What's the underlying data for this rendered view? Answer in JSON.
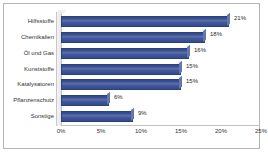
{
  "chart_data": {
    "type": "bar",
    "orientation": "horizontal",
    "title": "",
    "xlabel": "",
    "ylabel": "",
    "categories": [
      "Hilfsstoffe",
      "Chemikalien",
      "Öl und Gas",
      "Kunststoffe",
      "Katalysatoren",
      "Pflanzenschutz",
      "Sonstige"
    ],
    "values": [
      21,
      18,
      16,
      15,
      15,
      6,
      9
    ],
    "data_labels": [
      "21%",
      "18%",
      "16%",
      "15%",
      "15%",
      "6%",
      "9%"
    ],
    "xlim": [
      0,
      25
    ],
    "xticks": [
      0,
      5,
      10,
      15,
      20,
      25
    ],
    "xtick_labels": [
      "0%",
      "5%",
      "10%",
      "15%",
      "20%",
      "25%"
    ],
    "grid": false,
    "legend": false,
    "bar_color": "#3b5499",
    "bar_edge_color": "#2c4079",
    "frame_color": "#b5b5b5",
    "text_color": "#333333"
  }
}
